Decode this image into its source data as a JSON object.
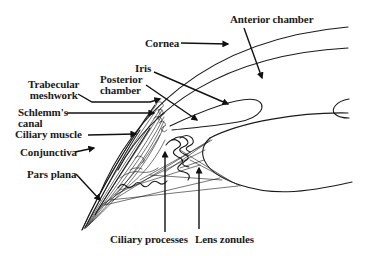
{
  "figure": {
    "background": "#ffffff",
    "ink_color": "#1a1a1a"
  },
  "labels": {
    "anterior_chamber": "Anterior chamber",
    "cornea": "Cornea",
    "iris": "Iris",
    "posterior_chamber_line1": "Posterior",
    "posterior_chamber_line2": "chamber",
    "trabecular_line1": "Trabecular",
    "trabecular_line2": "meshwork",
    "schlemm_line1": "Schlemm's",
    "schlemm_line2": "canal",
    "ciliary_muscle": "Ciliary muscle",
    "conjunctiva": "Conjunctiva",
    "pars_plana": "Pars plana",
    "ciliary_processes": "Ciliary processes",
    "lens_zonules": "Lens zonules"
  },
  "structures": [
    "cornea-outer-surface",
    "cornea-inner-surface",
    "iris",
    "lens",
    "pupil-edge",
    "ciliary-body",
    "ciliary-processes",
    "zonular-fibers",
    "sclera"
  ]
}
